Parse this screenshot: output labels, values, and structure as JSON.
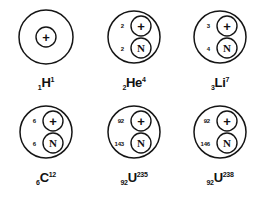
{
  "figure": {
    "stroke_color": "#151515",
    "background_color": "#ffffff",
    "proton_glyph": "+",
    "neutron_glyph": "N",
    "columns": 3,
    "rows": 2
  },
  "atoms": [
    {
      "id": "hydrogen-1",
      "element_symbol": "H",
      "atomic_number": "1",
      "mass_number": "1",
      "proton_count_label": "",
      "neutron_count_label": "",
      "proton_glyph": "+",
      "neutron_glyph": "",
      "has_neutron": false,
      "single_center": true
    },
    {
      "id": "helium-4",
      "element_symbol": "He",
      "atomic_number": "2",
      "mass_number": "4",
      "proton_count_label": "2",
      "neutron_count_label": "2",
      "proton_glyph": "+",
      "neutron_glyph": "N",
      "has_neutron": true,
      "single_center": false
    },
    {
      "id": "lithium-7",
      "element_symbol": "Li",
      "atomic_number": "3",
      "mass_number": "7",
      "proton_count_label": "3",
      "neutron_count_label": "4",
      "proton_glyph": "+",
      "neutron_glyph": "N",
      "has_neutron": true,
      "single_center": false
    },
    {
      "id": "carbon-12",
      "element_symbol": "C",
      "atomic_number": "6",
      "mass_number": "12",
      "proton_count_label": "6",
      "neutron_count_label": "6",
      "proton_glyph": "+",
      "neutron_glyph": "N",
      "has_neutron": true,
      "single_center": false
    },
    {
      "id": "uranium-235",
      "element_symbol": "U",
      "atomic_number": "92",
      "mass_number": "235",
      "proton_count_label": "92",
      "neutron_count_label": "143",
      "proton_glyph": "+",
      "neutron_glyph": "N",
      "has_neutron": true,
      "single_center": false
    },
    {
      "id": "uranium-238",
      "element_symbol": "U",
      "atomic_number": "92",
      "mass_number": "238",
      "proton_count_label": "92",
      "neutron_count_label": "146",
      "proton_glyph": "+",
      "neutron_glyph": "N",
      "has_neutron": true,
      "single_center": false
    }
  ]
}
